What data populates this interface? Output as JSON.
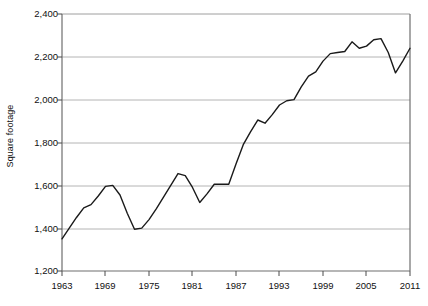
{
  "chart_data": {
    "type": "line",
    "title": "",
    "subtitle": "",
    "xlabel": "",
    "ylabel": "Square footage",
    "xlim": [
      1963,
      2011
    ],
    "ylim": [
      1200,
      2400
    ],
    "grid": true,
    "legend": null,
    "y_ticks": [
      "2,400",
      "2,200",
      "2,000",
      "1,800",
      "1,600",
      "1,400",
      "1,200"
    ],
    "y_tick_values": [
      2400,
      2200,
      2000,
      1800,
      1600,
      1400,
      1200
    ],
    "x_ticks": [
      "1963",
      "1969",
      "1975",
      "1981",
      "1987",
      "1993",
      "1999",
      "2005",
      "2011"
    ],
    "x_tick_values": [
      1963,
      1969,
      1975,
      1981,
      1987,
      1993,
      1999,
      2005,
      2011
    ],
    "series": [
      {
        "name": "Square footage",
        "color": "#1a1a1a",
        "x": [
          1963,
          1964,
          1965,
          1966,
          1967,
          1968,
          1969,
          1970,
          1971,
          1972,
          1973,
          1974,
          1975,
          1976,
          1977,
          1978,
          1979,
          1980,
          1981,
          1982,
          1983,
          1984,
          1985,
          1986,
          1987,
          1988,
          1989,
          1990,
          1991,
          1992,
          1993,
          1994,
          1995,
          1996,
          1997,
          1998,
          1999,
          2000,
          2001,
          2002,
          2003,
          2004,
          2005,
          2006,
          2007,
          2008,
          2009,
          2010,
          2011
        ],
        "values": [
          1350,
          1400,
          1450,
          1495,
          1510,
          1550,
          1595,
          1600,
          1555,
          1470,
          1395,
          1400,
          1440,
          1490,
          1545,
          1600,
          1655,
          1645,
          1590,
          1520,
          1560,
          1605,
          1605,
          1605,
          1700,
          1790,
          1850,
          1905,
          1890,
          1930,
          1975,
          1995,
          2000,
          2060,
          2110,
          2130,
          2180,
          2215,
          2220,
          2225,
          2270,
          2240,
          2250,
          2280,
          2285,
          2220,
          2125,
          2180,
          2240
        ]
      }
    ]
  }
}
